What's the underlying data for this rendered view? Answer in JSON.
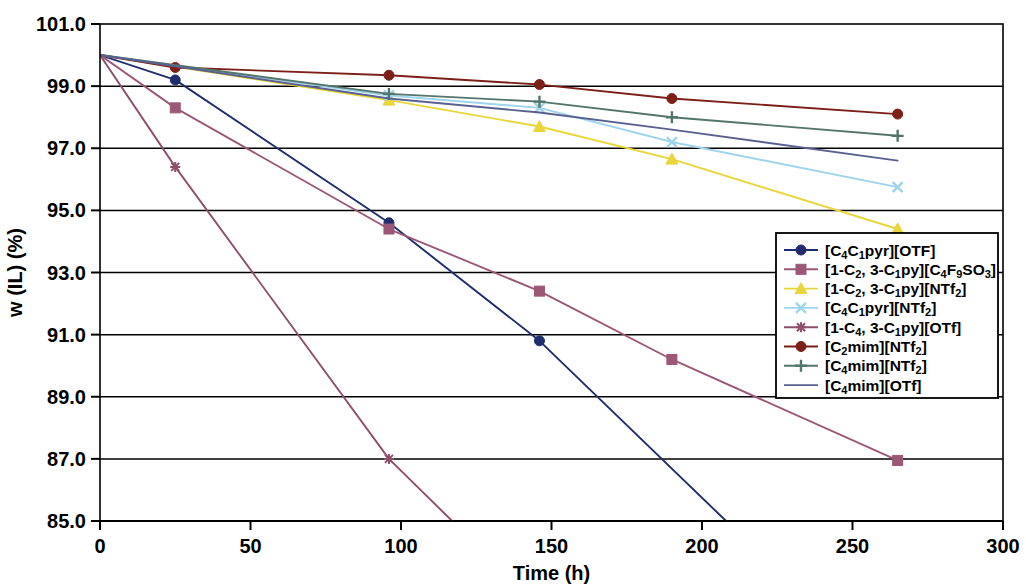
{
  "chart_data": {
    "type": "line",
    "title": "",
    "xlabel": "Time (h)",
    "ylabel": "w (IL) (%)",
    "xlim": [
      0,
      300
    ],
    "ylim": [
      85.0,
      101.0
    ],
    "xticks": [
      0,
      50,
      100,
      150,
      200,
      250,
      300
    ],
    "xticklabels": [
      "0",
      "50",
      "100",
      "150",
      "200",
      "250",
      "300"
    ],
    "yticks": [
      85.0,
      87.0,
      89.0,
      91.0,
      93.0,
      95.0,
      97.0,
      99.0,
      101.0
    ],
    "yticklabels": [
      "85.0",
      "87.0",
      "89.0",
      "91.0",
      "93.0",
      "95.0",
      "97.0",
      "99.0",
      "101.0"
    ],
    "grid": "horizontal",
    "legend_position": "center-right",
    "series": [
      {
        "name": "[C4C1pyr][OTF]",
        "label_parts": [
          {
            "t": "[C",
            "sub": false
          },
          {
            "t": "4",
            "sub": true
          },
          {
            "t": "C",
            "sub": false
          },
          {
            "t": "1",
            "sub": true
          },
          {
            "t": "pyr][OTF]",
            "sub": false
          }
        ],
        "color": "#1f2d6e",
        "marker": "circle",
        "x": [
          0,
          25,
          96,
          146,
          208
        ],
        "y": [
          100.0,
          99.2,
          94.6,
          90.8,
          85.0
        ]
      },
      {
        "name": "[1-C2, 3-C1py][C4F9SO3]",
        "label_parts": [
          {
            "t": "[1-C",
            "sub": false
          },
          {
            "t": "2",
            "sub": true
          },
          {
            "t": ", 3-C",
            "sub": false
          },
          {
            "t": "1",
            "sub": true
          },
          {
            "t": "py][C",
            "sub": false
          },
          {
            "t": "4",
            "sub": true
          },
          {
            "t": "F",
            "sub": false
          },
          {
            "t": "9",
            "sub": true
          },
          {
            "t": "SO",
            "sub": false
          },
          {
            "t": "3",
            "sub": true
          },
          {
            "t": "]",
            "sub": false
          }
        ],
        "color": "#9b5876",
        "marker": "square",
        "x": [
          0,
          25,
          96,
          146,
          190,
          265
        ],
        "y": [
          100.0,
          98.3,
          94.4,
          92.4,
          90.2,
          86.95
        ]
      },
      {
        "name": "[1-C2, 3-C1py][NTf2]",
        "label_parts": [
          {
            "t": "[1-C",
            "sub": false
          },
          {
            "t": "2",
            "sub": true
          },
          {
            "t": ", 3-C",
            "sub": false
          },
          {
            "t": "1",
            "sub": true
          },
          {
            "t": "py][NTf",
            "sub": false
          },
          {
            "t": "2",
            "sub": true
          },
          {
            "t": "]",
            "sub": false
          }
        ],
        "color": "#e8d63c",
        "marker": "triangle",
        "x": [
          0,
          96,
          146,
          190,
          265
        ],
        "y": [
          100.0,
          98.55,
          97.7,
          96.65,
          94.4
        ]
      },
      {
        "name": "[C4C1pyr][NTf2]",
        "label_parts": [
          {
            "t": "[C",
            "sub": false
          },
          {
            "t": "4",
            "sub": true
          },
          {
            "t": "C",
            "sub": false
          },
          {
            "t": "1",
            "sub": true
          },
          {
            "t": "pyr][NTf",
            "sub": false
          },
          {
            "t": "2",
            "sub": true
          },
          {
            "t": "]",
            "sub": false
          }
        ],
        "color": "#9fd4ea",
        "marker": "x",
        "x": [
          0,
          96,
          146,
          190,
          265
        ],
        "y": [
          100.0,
          98.7,
          98.3,
          97.2,
          95.75
        ]
      },
      {
        "name": "[1-C4, 3-C1py][OTf]",
        "label_parts": [
          {
            "t": "[1-C",
            "sub": false
          },
          {
            "t": "4",
            "sub": true
          },
          {
            "t": ", 3-C",
            "sub": false
          },
          {
            "t": "1",
            "sub": true
          },
          {
            "t": "py][OTf]",
            "sub": false
          }
        ],
        "color": "#8e4f6b",
        "marker": "star",
        "x": [
          0,
          25,
          96,
          117
        ],
        "y": [
          100.0,
          96.4,
          87.0,
          85.0
        ]
      },
      {
        "name": "[C2mim][NTf2]",
        "label_parts": [
          {
            "t": "[C",
            "sub": false
          },
          {
            "t": "2",
            "sub": true
          },
          {
            "t": "mim][NTf",
            "sub": false
          },
          {
            "t": "2",
            "sub": true
          },
          {
            "t": "]",
            "sub": false
          }
        ],
        "color": "#7b1f18",
        "marker": "circle",
        "x": [
          0,
          25,
          96,
          146,
          190,
          265
        ],
        "y": [
          100.0,
          99.6,
          99.35,
          99.05,
          98.6,
          98.1
        ]
      },
      {
        "name": "[C4mim][NTf2]",
        "label_parts": [
          {
            "t": "[C",
            "sub": false
          },
          {
            "t": "4",
            "sub": true
          },
          {
            "t": "mim][NTf",
            "sub": false
          },
          {
            "t": "2",
            "sub": true
          },
          {
            "t": "]",
            "sub": false
          }
        ],
        "color": "#54756b",
        "marker": "plus",
        "x": [
          0,
          96,
          146,
          190,
          265
        ],
        "y": [
          100.0,
          98.75,
          98.5,
          98.0,
          97.4
        ]
      },
      {
        "name": "[C4mim][OTf]",
        "label_parts": [
          {
            "t": "[C",
            "sub": false
          },
          {
            "t": "4",
            "sub": true
          },
          {
            "t": "mim][OTf]",
            "sub": false
          }
        ],
        "color": "#5a6090",
        "marker": "none",
        "x": [
          0,
          96,
          146,
          190,
          265
        ],
        "y": [
          100.0,
          98.6,
          98.15,
          97.6,
          96.6
        ]
      }
    ]
  },
  "axes": {
    "x_title": "Time (h)",
    "y_title": "w (IL) (%)"
  }
}
